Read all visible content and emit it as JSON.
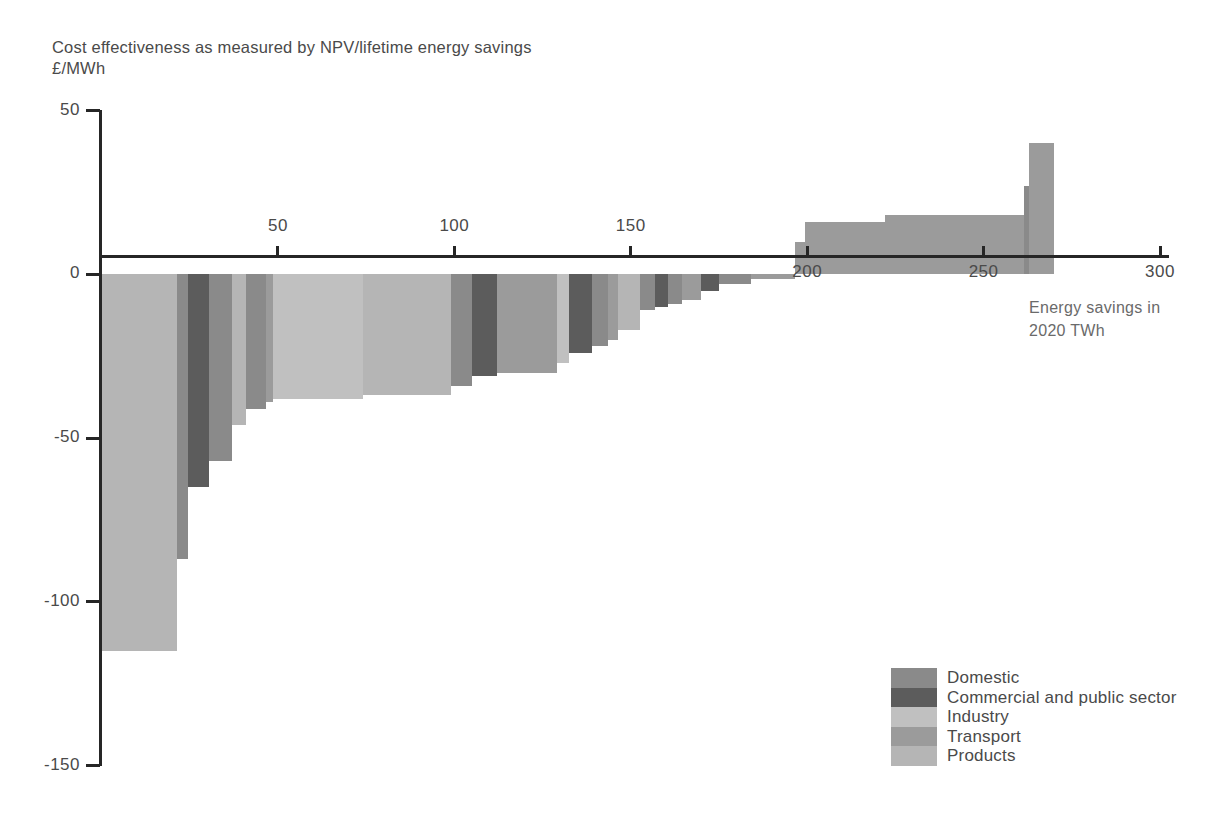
{
  "chart": {
    "title": "Cost effectiveness as measured by NPV/lifetime energy savings",
    "ylabel_units": "£/MWh",
    "xaxis_title": "Energy savings in\n2020 TWh"
  },
  "legend": {
    "items": [
      {
        "label": "Domestic",
        "color": "#8a8a8a"
      },
      {
        "label": "Commercial and public sector",
        "color": "#5c5c5c"
      },
      {
        "label": "Industry",
        "color": "#c0c0c0"
      },
      {
        "label": "Transport",
        "color": "#9b9b9b"
      },
      {
        "label": "Products",
        "color": "#b5b5b5"
      }
    ]
  },
  "chart_data": {
    "type": "bar",
    "title": "Cost effectiveness as measured by NPV/lifetime energy savings",
    "subtitle": "",
    "xlabel": "Energy savings in 2020 TWh",
    "ylabel": "£/MWh",
    "xlim": [
      0,
      300
    ],
    "ylim": [
      -150,
      50
    ],
    "grid": false,
    "legend_position": "bottom-right",
    "x_ticks": [
      0,
      50,
      100,
      150,
      200,
      250,
      300
    ],
    "y_ticks": [
      50,
      0,
      -50,
      -100,
      -150
    ],
    "note": "Marginal abatement style cost curve. Each bar spans an interval on the x-axis (energy savings in TWh) and its height is the cost effectiveness in £/MWh. Bars are sorted from most negative (cheapest) on the left to most positive on the right.",
    "bars": [
      {
        "x_start": 0,
        "x_end": 21.5,
        "value": -115,
        "category": "Products"
      },
      {
        "x_start": 21.5,
        "x_end": 24.5,
        "value": -87,
        "category": "Domestic"
      },
      {
        "x_start": 24.5,
        "x_end": 30.5,
        "value": -65,
        "category": "Commercial and public sector"
      },
      {
        "x_start": 30.5,
        "x_end": 37.0,
        "value": -57,
        "category": "Domestic"
      },
      {
        "x_start": 37.0,
        "x_end": 41.0,
        "value": -46,
        "category": "Products"
      },
      {
        "x_start": 41.0,
        "x_end": 46.5,
        "value": -41,
        "category": "Domestic"
      },
      {
        "x_start": 46.5,
        "x_end": 48.5,
        "value": -39,
        "category": "Transport"
      },
      {
        "x_start": 48.5,
        "x_end": 74.0,
        "value": -38,
        "category": "Industry"
      },
      {
        "x_start": 74.0,
        "x_end": 99.0,
        "value": -37,
        "category": "Products"
      },
      {
        "x_start": 99.0,
        "x_end": 105.0,
        "value": -34,
        "category": "Domestic"
      },
      {
        "x_start": 105.0,
        "x_end": 112.0,
        "value": -31,
        "category": "Commercial and public sector"
      },
      {
        "x_start": 112.0,
        "x_end": 129.0,
        "value": -30,
        "category": "Transport"
      },
      {
        "x_start": 129.0,
        "x_end": 132.5,
        "value": -27,
        "category": "Industry"
      },
      {
        "x_start": 132.5,
        "x_end": 139.0,
        "value": -24,
        "category": "Commercial and public sector"
      },
      {
        "x_start": 139.0,
        "x_end": 143.5,
        "value": -22,
        "category": "Domestic"
      },
      {
        "x_start": 143.5,
        "x_end": 146.5,
        "value": -20,
        "category": "Transport"
      },
      {
        "x_start": 146.5,
        "x_end": 152.5,
        "value": -17,
        "category": "Products"
      },
      {
        "x_start": 152.5,
        "x_end": 157.0,
        "value": -11,
        "category": "Domestic"
      },
      {
        "x_start": 157.0,
        "x_end": 160.5,
        "value": -10,
        "category": "Commercial and public sector"
      },
      {
        "x_start": 160.5,
        "x_end": 164.5,
        "value": -9,
        "category": "Domestic"
      },
      {
        "x_start": 164.5,
        "x_end": 170.0,
        "value": -8,
        "category": "Transport"
      },
      {
        "x_start": 170.0,
        "x_end": 175.0,
        "value": -5,
        "category": "Commercial and public sector"
      },
      {
        "x_start": 175.0,
        "x_end": 184.0,
        "value": -3,
        "category": "Domestic"
      },
      {
        "x_start": 184.0,
        "x_end": 196.5,
        "value": -1.5,
        "category": "Transport"
      },
      {
        "x_start": 196.5,
        "x_end": 199.5,
        "value": 10,
        "category": "Transport"
      },
      {
        "x_start": 199.5,
        "x_end": 222.0,
        "value": 16,
        "category": "Transport"
      },
      {
        "x_start": 222.0,
        "x_end": 261.5,
        "value": 18,
        "category": "Transport"
      },
      {
        "x_start": 261.5,
        "x_end": 263.0,
        "value": 27,
        "category": "Domestic"
      },
      {
        "x_start": 263.0,
        "x_end": 270.0,
        "value": 40,
        "category": "Transport"
      }
    ]
  }
}
